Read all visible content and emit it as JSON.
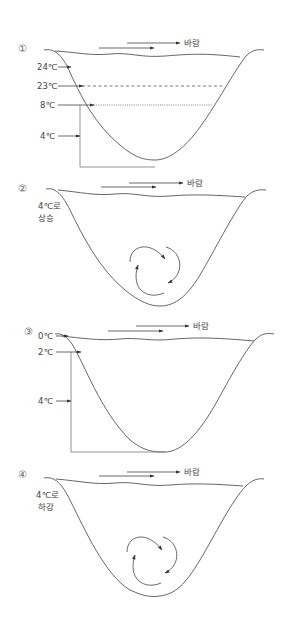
{
  "diagram": {
    "wind_label": "바람",
    "panels": [
      {
        "number": "①",
        "labels": [
          "24℃",
          "23℃",
          "8℃",
          "4℃"
        ]
      },
      {
        "number": "②",
        "label_line1": "4℃로",
        "label_line2": "상승"
      },
      {
        "number": "③",
        "labels": [
          "0℃",
          "2℃",
          "4℃"
        ]
      },
      {
        "number": "④",
        "label_line1": "4℃로",
        "label_line2": "하강"
      }
    ]
  }
}
